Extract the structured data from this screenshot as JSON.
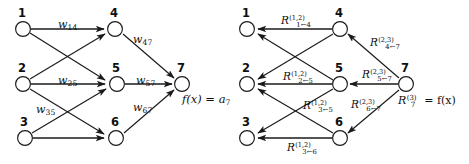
{
  "figure": {
    "stroke_color": "#1a1a1a",
    "background_color": "#ffffff"
  },
  "left_diagram": {
    "name": "forward-pass-network",
    "nodes": [
      {
        "id": "1",
        "label": "1",
        "cx": 23,
        "cy": 29,
        "num_x": 18,
        "num_y": 8
      },
      {
        "id": "2",
        "label": "2",
        "cx": 23,
        "cy": 84,
        "num_x": 18,
        "num_y": 63
      },
      {
        "id": "3",
        "label": "3",
        "cx": 25,
        "cy": 138,
        "num_x": 20,
        "num_y": 117
      },
      {
        "id": "4",
        "label": "4",
        "cx": 115,
        "cy": 29,
        "num_x": 110,
        "num_y": 8
      },
      {
        "id": "5",
        "label": "5",
        "cx": 117,
        "cy": 84,
        "num_x": 112,
        "num_y": 63
      },
      {
        "id": "6",
        "label": "6",
        "cx": 116,
        "cy": 138,
        "num_x": 111,
        "num_y": 117
      },
      {
        "id": "7",
        "label": "7",
        "cx": 182,
        "cy": 84,
        "num_x": 177,
        "num_y": 63
      }
    ],
    "edges": [
      {
        "from": "1",
        "to": "4",
        "label": "w",
        "sub": "14"
      },
      {
        "from": "1",
        "to": "5",
        "label": "",
        "sub": ""
      },
      {
        "from": "2",
        "to": "4",
        "label": "",
        "sub": ""
      },
      {
        "from": "2",
        "to": "5",
        "label": "w",
        "sub": "25"
      },
      {
        "from": "2",
        "to": "6",
        "label": "",
        "sub": ""
      },
      {
        "from": "3",
        "to": "5",
        "label": "w",
        "sub": "35"
      },
      {
        "from": "3",
        "to": "6",
        "label": "",
        "sub": ""
      },
      {
        "from": "4",
        "to": "7",
        "label": "w",
        "sub": "47"
      },
      {
        "from": "5",
        "to": "7",
        "label": "w",
        "sub": "57"
      },
      {
        "from": "6",
        "to": "7",
        "label": "w",
        "sub": "67"
      }
    ],
    "weight_labels": [
      {
        "name": "weight-w14",
        "base": "w",
        "sub": "14",
        "x": 58,
        "y": 19
      },
      {
        "name": "weight-w47",
        "base": "w",
        "sub": "47",
        "x": 133,
        "y": 34
      },
      {
        "name": "weight-w25",
        "base": "w",
        "sub": "25",
        "x": 58,
        "y": 75
      },
      {
        "name": "weight-w57",
        "base": "w",
        "sub": "57",
        "x": 136,
        "y": 75
      },
      {
        "name": "weight-w35",
        "base": "w",
        "sub": "35",
        "x": 36,
        "y": 104
      },
      {
        "name": "weight-w67",
        "base": "w",
        "sub": "67",
        "x": 133,
        "y": 102
      }
    ],
    "output_label": {
      "name": "output-fx",
      "text": "f(x) = a",
      "sub": "7",
      "x": 182,
      "y": 94
    }
  },
  "right_diagram": {
    "name": "relevance-backward-network",
    "nodes": [
      {
        "id": "1",
        "label": "1",
        "cx": 247,
        "cy": 29,
        "num_x": 242,
        "num_y": 8
      },
      {
        "id": "2",
        "label": "2",
        "cx": 247,
        "cy": 84,
        "num_x": 242,
        "num_y": 63
      },
      {
        "id": "3",
        "label": "3",
        "cx": 247,
        "cy": 138,
        "num_x": 242,
        "num_y": 117
      },
      {
        "id": "4",
        "label": "4",
        "cx": 340,
        "cy": 29,
        "num_x": 335,
        "num_y": 8
      },
      {
        "id": "5",
        "label": "5",
        "cx": 340,
        "cy": 84,
        "num_x": 335,
        "num_y": 63
      },
      {
        "id": "6",
        "label": "6",
        "cx": 340,
        "cy": 138,
        "num_x": 335,
        "num_y": 117
      },
      {
        "id": "7",
        "label": "7",
        "cx": 406,
        "cy": 84,
        "num_x": 401,
        "num_y": 63
      }
    ],
    "relevance_labels": [
      {
        "name": "relevance-1-from-4",
        "base": "R",
        "sup": "(1,2)",
        "sub": "1←4",
        "x": 281,
        "y": 15
      },
      {
        "name": "relevance-4-from-7",
        "base": "R",
        "sup": "(2,3)",
        "sub": "4←7",
        "x": 370,
        "y": 37
      },
      {
        "name": "relevance-2-from-5",
        "base": "R",
        "sup": "(1,2)",
        "sub": "2←5",
        "x": 283,
        "y": 71
      },
      {
        "name": "relevance-5-from-7",
        "base": "R",
        "sup": "(2,3)",
        "sub": "5←7",
        "x": 362,
        "y": 69
      },
      {
        "name": "relevance-3-from-5",
        "base": "R",
        "sup": "(1,2)",
        "sub": "3←5",
        "x": 303,
        "y": 100
      },
      {
        "name": "relevance-6-from-7",
        "base": "R",
        "sup": "(2,3)",
        "sub": "6←7",
        "x": 351,
        "y": 99
      },
      {
        "name": "relevance-3-from-6",
        "base": "R",
        "sup": "(1,2)",
        "sub": "3←6",
        "x": 287,
        "y": 142
      }
    ],
    "output_label": {
      "name": "output-relevance-r7",
      "base": "R",
      "sup": "(3)",
      "sub": "7",
      "eq": " = f(x)",
      "x": 398,
      "y": 95
    }
  }
}
